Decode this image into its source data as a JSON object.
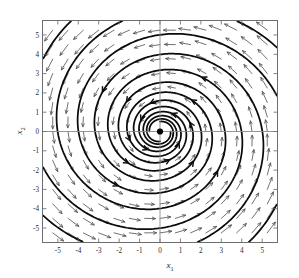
{
  "figure": {
    "title": "",
    "caption": ""
  },
  "axes": {
    "xlabel": "x",
    "xlabel_sub": "1",
    "ylabel": "x",
    "ylabel_sub": "2",
    "x_ticks": [
      -5,
      -4,
      -3,
      -2,
      -1,
      0,
      1,
      2,
      3,
      4,
      5
    ],
    "x_tick_labels": [
      "-5",
      "-4",
      "-3",
      "-2",
      "-1",
      "0",
      "1",
      "2",
      "3",
      "4",
      "5"
    ],
    "y_ticks": [
      -5,
      -4,
      -3,
      -2,
      -1,
      0,
      1,
      2,
      3,
      4,
      5
    ],
    "y_tick_labels": [
      "-5",
      "-4",
      "-3",
      "-2",
      "-1",
      "0",
      "1",
      "2",
      "3",
      "4",
      "5"
    ],
    "xlim": [
      -5.75,
      5.75
    ],
    "ylim": [
      -5.75,
      5.75
    ],
    "grid": false,
    "zero_axes_drawn": true
  },
  "chart_data": {
    "type": "line",
    "title": "",
    "xlabel": "x1",
    "ylabel": "x2",
    "xlim": [
      -5.75,
      5.75
    ],
    "ylim": [
      -5.75,
      5.75
    ],
    "grid": false,
    "legend": [],
    "plot_kind": "phase-portrait",
    "system": {
      "description": "Planar linear system with a stable spiral (spiral sink) equilibrium at the origin",
      "equilibrium": [
        0,
        0
      ],
      "equilibrium_type": "stable spiral / spiral sink",
      "rotation": "counterclockwise",
      "decay_rate_a": 0.145,
      "angular_rate_b": 1.0
    },
    "spiral_params": {
      "radius_model": "r(theta) = r0 * exp(-a * theta)",
      "r0_values": [
        7.9,
        7.9,
        7.9,
        7.9
      ],
      "theta0_offsets_deg": [
        0,
        90,
        180,
        270
      ],
      "theta_span_deg": 1080,
      "count": 4
    },
    "series": [
      {
        "name": "trajectory-1",
        "theta0_deg": 0,
        "r0": 7.9,
        "points_theta_deg": [
          0,
          90,
          180,
          270,
          360,
          450,
          540,
          630,
          720,
          810,
          900,
          990,
          1080
        ],
        "points_r": [
          7.9,
          6.28,
          4.99,
          3.96,
          3.15,
          2.5,
          1.99,
          1.58,
          1.25,
          1.0,
          0.79,
          0.63,
          0.5
        ]
      },
      {
        "name": "trajectory-2",
        "theta0_deg": 90,
        "r0": 7.9,
        "points_theta_deg": [
          0,
          90,
          180,
          270,
          360,
          450,
          540,
          630,
          720,
          810,
          900,
          990,
          1080
        ],
        "points_r": [
          7.9,
          6.28,
          4.99,
          3.96,
          3.15,
          2.5,
          1.99,
          1.58,
          1.25,
          1.0,
          0.79,
          0.63,
          0.5
        ]
      },
      {
        "name": "trajectory-3",
        "theta0_deg": 180,
        "r0": 7.9,
        "points_theta_deg": [
          0,
          90,
          180,
          270,
          360,
          450,
          540,
          630,
          720,
          810,
          900,
          990,
          1080
        ],
        "points_r": [
          7.9,
          6.28,
          4.99,
          3.96,
          3.15,
          2.5,
          1.99,
          1.58,
          1.25,
          1.0,
          0.79,
          0.63,
          0.5
        ]
      },
      {
        "name": "trajectory-4",
        "theta0_deg": 270,
        "r0": 7.9,
        "points_theta_deg": [
          0,
          90,
          180,
          270,
          360,
          450,
          540,
          630,
          720,
          810,
          900,
          990,
          1080
        ],
        "points_r": [
          7.9,
          6.28,
          4.99,
          3.96,
          3.15,
          2.5,
          1.99,
          1.58,
          1.25,
          1.0,
          0.79,
          0.63,
          0.5
        ]
      }
    ],
    "vector_field": {
      "kind": "quiver",
      "grid_min": -5.25,
      "grid_max": 5.25,
      "grid_step": 0.75,
      "arrow_direction_rule": "v = (-a*x - b*y, b*x - a*y), counterclockwise inward spiral",
      "quadrant_directions": {
        "upper_right": "up",
        "upper_left": "left",
        "lower_left": "down",
        "lower_right": "right"
      }
    }
  },
  "colors": {
    "background": "#ffffff",
    "frame": "#6d6d6d",
    "zero_axis": "#8a8a8a",
    "trajectory": "#0b0b0b",
    "quiver": "#4a4a4a",
    "text": "#2b2b2b"
  }
}
